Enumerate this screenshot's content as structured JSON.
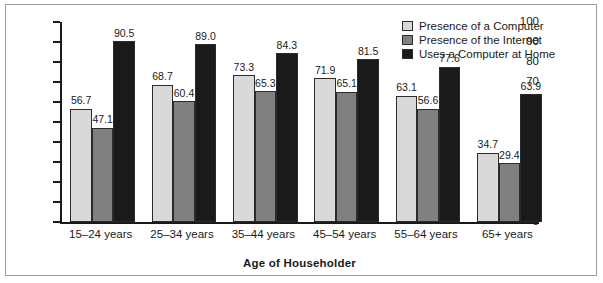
{
  "chart_data": {
    "type": "bar",
    "title": "",
    "xlabel": "Age of Householder",
    "ylabel": "Percent",
    "ylim": [
      0,
      100
    ],
    "ytick_step": 10,
    "yticks": [
      "100",
      "90",
      "80",
      "70",
      "60",
      "50",
      "40",
      "30",
      "20",
      "10",
      "0"
    ],
    "grid": false,
    "legend_position": "top-right",
    "categories": [
      "15–24 years",
      "25–34 years",
      "35–44 years",
      "45–54 years",
      "55–64 years",
      "65+ years"
    ],
    "series": [
      {
        "name": "Presence of a Computer",
        "color": "#d9d9d9",
        "values": [
          56.7,
          68.7,
          73.3,
          71.9,
          63.1,
          34.7
        ],
        "labels": [
          "56.7",
          "68.7",
          "73.3",
          "71.9",
          "63.1",
          "34.7"
        ]
      },
      {
        "name": "Presence of the Internet",
        "color": "#808080",
        "values": [
          47.1,
          60.4,
          65.3,
          65.1,
          56.6,
          29.4
        ],
        "labels": [
          "47.1",
          "60.4",
          "65.3",
          "65.1",
          "56.6",
          "29.4"
        ]
      },
      {
        "name": "Uses a Computer at Home",
        "color": "#1a1a1a",
        "values": [
          90.5,
          89.0,
          84.3,
          81.5,
          77.6,
          63.9
        ],
        "labels": [
          "90.5",
          "89.0",
          "84.3",
          "81.5",
          "77.6",
          "63.9"
        ]
      }
    ]
  },
  "legend": {
    "items": [
      {
        "label": "Presence of a Computer",
        "color": "#d9d9d9"
      },
      {
        "label": "Presence of the Internet",
        "color": "#808080"
      },
      {
        "label": "Uses a Computer at Home",
        "color": "#1a1a1a"
      }
    ]
  },
  "colors": {
    "background": "#ffffff",
    "frame": "#9a9a9a",
    "axis": "#1a1a1a",
    "text": "#1a1a1a",
    "series_light": "#d9d9d9",
    "series_medium": "#808080",
    "series_dark": "#1a1a1a"
  }
}
